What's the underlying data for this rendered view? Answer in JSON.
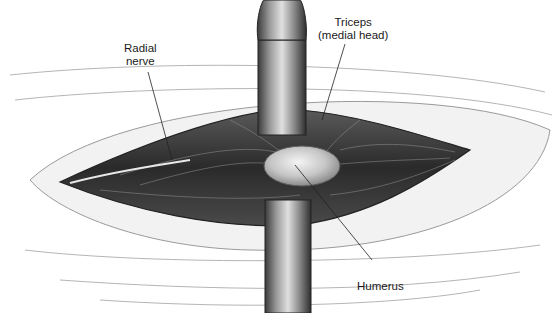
{
  "figure": {
    "type": "surgical-illustration",
    "colors": {
      "background": "#ffffff",
      "skin": "#f1f1f1",
      "tissue_dark": "#3a3a3a",
      "retractor": "#6b6b6b",
      "bone": "#c8c8c8",
      "leader_line": "#222222"
    }
  },
  "labels": {
    "radial_nerve": "Radial\nnerve",
    "triceps": "Triceps\n(medial head)",
    "humerus": "Humerus"
  }
}
